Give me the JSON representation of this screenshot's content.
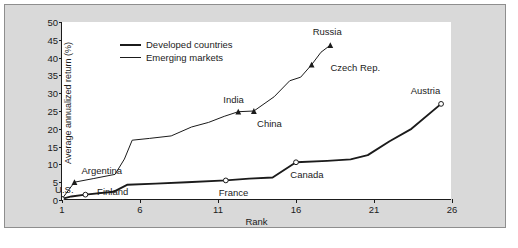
{
  "chart_data": {
    "type": "line",
    "title": "",
    "xlabel": "Rank",
    "ylabel": "Average annualized return (%)",
    "xlim": [
      1,
      26
    ],
    "ylim": [
      0,
      50
    ],
    "xticks": [
      1,
      6,
      11,
      16,
      21,
      26
    ],
    "yticks": [
      0,
      5,
      10,
      15,
      20,
      25,
      30,
      35,
      40,
      45,
      50
    ],
    "grid": false,
    "legend_position": "top-left",
    "series": [
      {
        "name": "Developed countries",
        "marker": "open-circle",
        "line_width": "thick",
        "color": "#1b1b1b",
        "x": [
          1,
          1.6,
          2.5,
          4.3,
          5.2,
          7.0,
          9.0,
          11.5,
          13.0,
          14.5,
          16.0,
          18.0,
          19.5,
          20.6,
          22.0,
          23.4,
          25.3
        ],
        "y": [
          0.3,
          1.0,
          1.5,
          2.3,
          4.3,
          4.6,
          5.0,
          5.5,
          6.0,
          6.3,
          10.6,
          11.0,
          11.4,
          12.6,
          16.5,
          20.0,
          27.0
        ]
      },
      {
        "name": "Emerging markets",
        "marker": "filled-triangle",
        "line_width": "thin",
        "color": "#1b1b1b",
        "x": [
          1,
          1.8,
          3.0,
          4.4,
          5.0,
          5.5,
          6.6,
          8.0,
          9.3,
          10.4,
          11.4,
          12.3,
          13.3,
          14.6,
          15.6,
          16.3,
          17.0,
          17.6,
          18.2
        ],
        "y": [
          0.3,
          5.0,
          6.0,
          7.2,
          11.5,
          16.8,
          17.3,
          18.0,
          20.5,
          21.8,
          23.5,
          24.8,
          25.0,
          29.0,
          33.5,
          34.5,
          38.0,
          41.5,
          43.5
        ]
      }
    ],
    "annotations": [
      {
        "label": "U.S.",
        "series": "Developed countries",
        "x": 1,
        "y": 0.3,
        "lx": 1.15,
        "ly": 3.1
      },
      {
        "label": "Finland",
        "series": "Developed countries",
        "x": 2.5,
        "y": 1.5,
        "lx": 4.25,
        "ly": 2.6
      },
      {
        "label": "France",
        "series": "Developed countries",
        "x": 11.5,
        "y": 5.5,
        "lx": 12.0,
        "ly": 2.3
      },
      {
        "label": "Canada",
        "series": "Developed countries",
        "x": 16.0,
        "y": 10.6,
        "lx": 16.7,
        "ly": 7.2
      },
      {
        "label": "Austria",
        "series": "Developed countries",
        "x": 25.3,
        "y": 27.0,
        "lx": 24.3,
        "ly": 30.8
      },
      {
        "label": "Argentina",
        "series": "Emerging markets",
        "x": 1.8,
        "y": 5.0,
        "lx": 3.55,
        "ly": 8.3
      },
      {
        "label": "India",
        "series": "Emerging markets",
        "x": 12.3,
        "y": 24.8,
        "lx": 12.0,
        "ly": 28.4
      },
      {
        "label": "China",
        "series": "Emerging markets",
        "x": 13.3,
        "y": 25.0,
        "lx": 14.3,
        "ly": 21.6
      },
      {
        "label": "Czech Rep.",
        "series": "Emerging markets",
        "x": 17.0,
        "y": 38.0,
        "lx": 19.8,
        "ly": 37.3
      },
      {
        "label": "Russia",
        "series": "Emerging markets",
        "x": 18.2,
        "y": 43.5,
        "lx": 18.0,
        "ly": 47.4
      }
    ]
  },
  "legend": {
    "items": [
      {
        "label": "Developed countries",
        "style": "thick"
      },
      {
        "label": "Emerging markets",
        "style": "thin"
      }
    ]
  },
  "caption": ""
}
